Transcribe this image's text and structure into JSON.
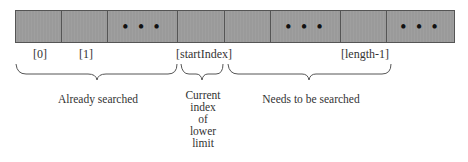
{
  "array": {
    "cells": [
      {
        "x": 15,
        "w": 47,
        "content": ""
      },
      {
        "x": 61,
        "w": 47,
        "content": ""
      },
      {
        "x": 107,
        "w": 71,
        "content": "• • •"
      },
      {
        "x": 177,
        "w": 48,
        "content": ""
      },
      {
        "x": 224,
        "w": 47,
        "content": ""
      },
      {
        "x": 270,
        "w": 71,
        "content": "• • •"
      },
      {
        "x": 340,
        "w": 47,
        "content": ""
      },
      {
        "x": 386,
        "w": 69,
        "content": "• • •"
      }
    ],
    "cell_color": "#9a9a9a"
  },
  "indices": [
    {
      "label": "[0]",
      "x": 33
    },
    {
      "label": "[1]",
      "x": 79
    },
    {
      "label": "[startIndex]",
      "x": 176
    },
    {
      "label": "[length-1]",
      "x": 341
    }
  ],
  "regions": {
    "already_searched": "Already searched",
    "current_index": [
      "Current",
      "index",
      "of",
      "lower",
      "limit"
    ],
    "needs_search": "Needs to be searched"
  }
}
